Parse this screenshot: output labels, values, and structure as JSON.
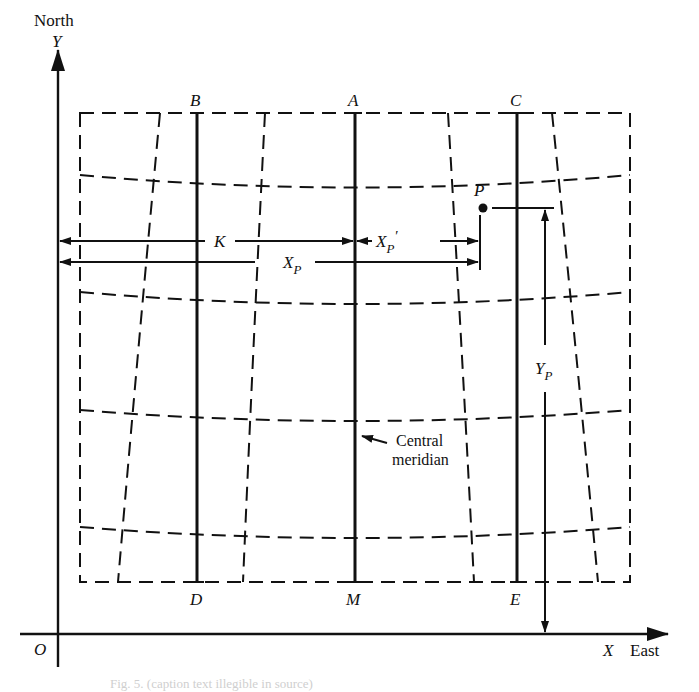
{
  "figure": {
    "type": "map-projection-grid-diagram",
    "axes": {
      "y_axis": {
        "name": "Y",
        "direction_label": "North"
      },
      "x_axis": {
        "name": "X",
        "direction_label": "East"
      },
      "origin_label": "O"
    },
    "meridian_labels": {
      "top": [
        "B",
        "A",
        "C"
      ],
      "bottom": [
        "D",
        "M",
        "E"
      ]
    },
    "point": {
      "label": "P"
    },
    "dimensions": {
      "k": {
        "label": "K"
      },
      "xp": {
        "label": "X",
        "subscript": "P"
      },
      "xp_prime": {
        "label": "X",
        "subscript": "P",
        "prime": "′"
      },
      "yp": {
        "label": "Y",
        "subscript": "P"
      }
    },
    "annotation": {
      "line1": "Central",
      "line2": "meridian"
    },
    "caption": "Fig. 5.  (caption text illegible in source)"
  }
}
